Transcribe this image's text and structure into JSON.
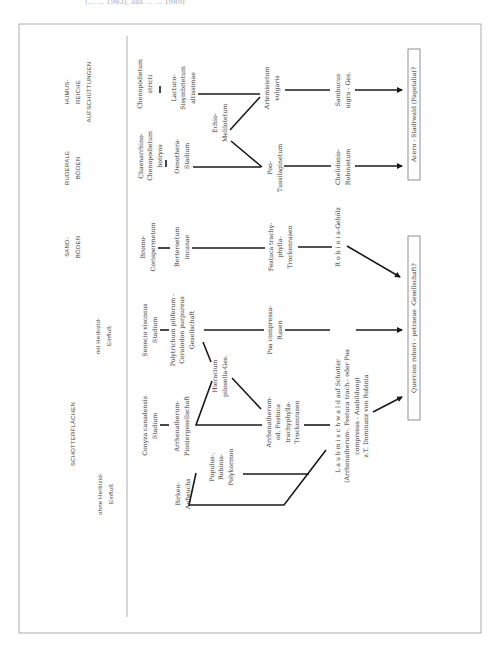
{
  "caption_fragment": "(… … 1983), aus … … 1989)",
  "colors": {
    "line": "#1a1a1a",
    "frame": "#9a9a9a",
    "text": "#333333"
  },
  "headers": [
    {
      "id": "humus",
      "lines": [
        "HUMUS-",
        "REICHE",
        "AUFSCHÜTTUNGEN"
      ],
      "x": 78,
      "y": 92
    },
    {
      "id": "ruderale",
      "lines": [
        "RUDERALE",
        "BÖDEN"
      ],
      "x": 72,
      "y": 168
    },
    {
      "id": "sand",
      "lines": [
        "SAND-",
        "BÖDEN"
      ],
      "x": 72,
      "y": 247
    },
    {
      "id": "mit-herbizid",
      "lines": [
        "mit Herbizid-",
        "Einfluß"
      ],
      "x": 103,
      "y": 336
    },
    {
      "id": "schotter",
      "lines": [
        "SCHOTTERFLÄCHEN"
      ],
      "x": 73,
      "y": 434
    },
    {
      "id": "ohne-herbizid",
      "lines": [
        "ohne Herbizid-",
        "Einfluß"
      ],
      "x": 105,
      "y": 494
    }
  ],
  "nodes": [
    {
      "id": "chenopodietum-stricti",
      "lines": [
        "Chenopodietum",
        "stricti"
      ],
      "x": 145,
      "y": 84
    },
    {
      "id": "lactuco-sisymbrietum",
      "lines": [
        "Lactuco-",
        "Sisymbrietum",
        "altissimae"
      ],
      "x": 183,
      "y": 88
    },
    {
      "id": "chenarrhino-chenopodietum",
      "lines": [
        "Chaenarrhino-",
        "Chenopodietum",
        "botryos"
      ],
      "x": 150,
      "y": 156
    },
    {
      "id": "oenothera-stadium",
      "lines": [
        "Oenothera-",
        "Stadium"
      ],
      "x": 182,
      "y": 156
    },
    {
      "id": "echio-melilotetum",
      "lines": [
        "Echio-",
        "Melilotetum"
      ],
      "x": 220,
      "y": 123
    },
    {
      "id": "artemisietum",
      "lines": [
        "Artemisietum",
        "vulgaris"
      ],
      "x": 272,
      "y": 88
    },
    {
      "id": "poo-tussilaginetum",
      "lines": [
        "Poo-",
        "Tussilaginetum"
      ],
      "x": 275,
      "y": 168
    },
    {
      "id": "sambucus",
      "lines": [
        "Sambucus",
        "nigra - Ges."
      ],
      "x": 343,
      "y": 90
    },
    {
      "id": "chelidonio-robinietum",
      "lines": [
        "Chelidonio-",
        "Robinietum"
      ],
      "x": 343,
      "y": 167
    },
    {
      "id": "bromo-corispermetum",
      "lines": [
        "Bromo-",
        "Corispermetum"
      ],
      "x": 148,
      "y": 247
    },
    {
      "id": "berteroetum",
      "lines": [
        "Berteroetum",
        "incanae"
      ],
      "x": 182,
      "y": 247
    },
    {
      "id": "festuca-trockenrasen",
      "lines": [
        "Festuca trachy-",
        "phylla-",
        "Trockenrasen"
      ],
      "x": 280,
      "y": 247
    },
    {
      "id": "robinia-gehoelz",
      "lines": [
        "R o b i n i a-Gehölz"
      ],
      "x": 338,
      "y": 237
    },
    {
      "id": "senecio-stadium",
      "lines": [
        "Senecio viscosus",
        "Stadium"
      ],
      "x": 150,
      "y": 330
    },
    {
      "id": "polytrichum-gesellschaft",
      "lines": [
        "Polytrichum piliferum -",
        "Ceratodon purpureus",
        "Gesellschaft"
      ],
      "x": 182,
      "y": 330
    },
    {
      "id": "poa-compressa-rasen",
      "lines": [
        "Poa compressa-",
        "Rasen"
      ],
      "x": 275,
      "y": 330
    },
    {
      "id": "hieracium",
      "lines": [
        "Hieracium",
        "pilosella-Ges."
      ],
      "x": 220,
      "y": 376
    },
    {
      "id": "conyza-stadium",
      "lines": [
        "Conyza canadensis",
        "Stadium"
      ],
      "x": 150,
      "y": 426
    },
    {
      "id": "arrhenatherum-pionier",
      "lines": [
        "Arrhenatherum-",
        "Pioniergesellschaft"
      ],
      "x": 182,
      "y": 426
    },
    {
      "id": "arrhenatherum-festuca",
      "lines": [
        "Arrhenatherum-",
        "od. Festuca",
        "trachyphylla-",
        "Trockenrasen"
      ],
      "x": 283,
      "y": 422
    },
    {
      "id": "laubmischwald",
      "lines": [
        "L a u b m i s c h w a l d  auf Schotter",
        "(Arrhenatherum-, Festuca trach.- oder Poa",
        "compressa - Ausbildung)",
        "z.T. Dominanz von Robinia"
      ],
      "x": 352,
      "y": 416
    },
    {
      "id": "birken-aufwuchs",
      "lines": [
        "Birken-",
        "Aufwuchs"
      ],
      "x": 183,
      "y": 494
    },
    {
      "id": "populus-polykormon",
      "lines": [
        "Populus-,",
        "Robinia-",
        "Polykormon"
      ],
      "x": 221,
      "y": 467
    }
  ],
  "boxes": [
    {
      "id": "acero-stadtwald",
      "label": "Acero - Stadtwald (Fagetalia)?",
      "x": 408,
      "y": 49,
      "w": 12,
      "h": 131
    },
    {
      "id": "querco-gesellschaft",
      "label": "Quercion robori - petraeae -Gesellschaft?",
      "x": 408,
      "y": 236,
      "w": 12,
      "h": 184
    }
  ]
}
